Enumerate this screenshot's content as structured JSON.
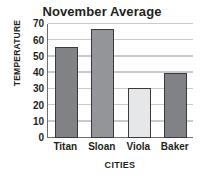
{
  "chart_data": {
    "type": "bar",
    "title": "November Average",
    "xlabel": "CITIES",
    "ylabel": "TEMPERATURE",
    "categories": [
      "Titan",
      "Sloan",
      "Viola",
      "Baker"
    ],
    "values": [
      56,
      67,
      31,
      40
    ],
    "series": [
      {
        "name": "November Average Temperature",
        "values": [
          56,
          67,
          31,
          40
        ]
      }
    ],
    "bar_colors": [
      "#808285",
      "#939598",
      "#e6e7e8",
      "#808285"
    ],
    "bar_border_color": "#3a3a3c",
    "ylim": [
      0,
      70
    ],
    "ytick_step": 10,
    "yticks": [
      70,
      60,
      50,
      40,
      30,
      20,
      10,
      0
    ],
    "ytick_labels": [
      "70",
      "60",
      "50",
      "40",
      "30",
      "20",
      "10",
      "0"
    ],
    "grid": true,
    "grid_color": "#c9cacc",
    "axis_color": "#6d6e71",
    "legend": false,
    "legend_position": "none",
    "background": "#ffffff",
    "text_color": "#231f20"
  }
}
